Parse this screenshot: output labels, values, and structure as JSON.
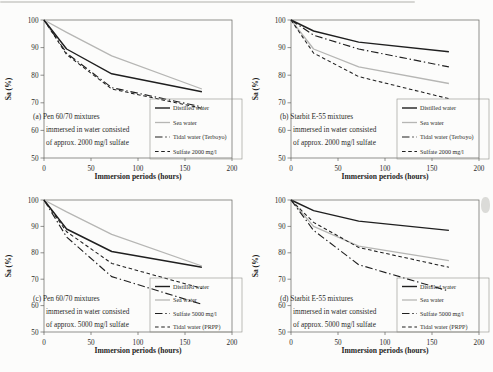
{
  "figure": {
    "colors": {
      "black_line": "#1f1f1f",
      "gray_line": "#b6b6b4",
      "frame": "#63635f",
      "legend_border": "#8f8f8b",
      "text": "#2b2b28",
      "background": "#fcfcfb"
    }
  },
  "chart_data": [
    {
      "type": "line",
      "panel": "a",
      "annotation": [
        "(a) Pen 60/70 mixtures",
        "immersed in water consisted",
        "of approx. 2000 mg/l sulfate"
      ],
      "xlabel": "Immersion periods (hours)",
      "ylabel": "Sa (%)",
      "xlim": [
        0,
        200
      ],
      "ylim": [
        50,
        100
      ],
      "xticks": [
        0,
        50,
        100,
        150,
        200
      ],
      "yticks": [
        50,
        60,
        70,
        80,
        90,
        100
      ],
      "grid": false,
      "legend_position": "bottom-right",
      "x": [
        0,
        24,
        72,
        168
      ],
      "series": [
        {
          "name": "Distilled water",
          "style": "solid-black",
          "values": [
            100,
            89.5,
            80.5,
            74
          ]
        },
        {
          "name": "Sea water",
          "style": "solid-gray",
          "values": [
            100,
            95.5,
            87,
            75
          ]
        },
        {
          "name": "Tidal water (Terboyo)",
          "style": "dashdot-black",
          "values": [
            100,
            88,
            75.5,
            68.5
          ]
        },
        {
          "name": "Sulfate 2000 mg/l",
          "style": "dash-black",
          "values": [
            100,
            87.5,
            75,
            68
          ]
        }
      ]
    },
    {
      "type": "line",
      "panel": "b",
      "annotation": [
        "(b) Starbit E-55 mixtures",
        "immersed in water consisted",
        "of approx. 2000 mg/l sulfate"
      ],
      "xlabel": "Immersion periods (hours)",
      "ylabel": "Sa (%)",
      "xlim": [
        0,
        200
      ],
      "ylim": [
        50,
        100
      ],
      "xticks": [
        0,
        50,
        100,
        150,
        200
      ],
      "yticks": [
        50,
        60,
        70,
        80,
        90,
        100
      ],
      "grid": false,
      "legend_position": "bottom-right",
      "x": [
        0,
        24,
        72,
        168
      ],
      "series": [
        {
          "name": "Distilled water",
          "style": "solid-black",
          "values": [
            100,
            96,
            92,
            88.5
          ]
        },
        {
          "name": "Sea water",
          "style": "solid-gray",
          "values": [
            100,
            89.5,
            83,
            77
          ]
        },
        {
          "name": "Tidal water (Terboyo)",
          "style": "dashdot-black",
          "values": [
            100,
            94.5,
            89.5,
            83
          ]
        },
        {
          "name": "Sulfate 2000 mg/l",
          "style": "dash-black",
          "values": [
            100,
            88,
            79.5,
            71.5
          ]
        }
      ]
    },
    {
      "type": "line",
      "panel": "c",
      "annotation": [
        "(c) Pen 60/70 mixtures",
        "immersed in water consisted",
        "of approx. 5000 mg/l sulfate"
      ],
      "xlabel": "Immersion periods (hours)",
      "ylabel": "Sa (%)",
      "xlim": [
        0,
        200
      ],
      "ylim": [
        50,
        100
      ],
      "xticks": [
        0,
        50,
        100,
        150,
        200
      ],
      "yticks": [
        50,
        60,
        70,
        80,
        90,
        100
      ],
      "grid": false,
      "legend_position": "bottom-right",
      "x": [
        0,
        24,
        72,
        168
      ],
      "series": [
        {
          "name": "Distilled water",
          "style": "solid-black",
          "values": [
            100,
            89,
            80.5,
            74.5
          ]
        },
        {
          "name": "Sea water",
          "style": "solid-gray",
          "values": [
            100,
            95.5,
            87,
            75
          ]
        },
        {
          "name": "Sulfate 5000 mg/l",
          "style": "dashdot-black",
          "values": [
            100,
            86,
            71,
            60.5
          ]
        },
        {
          "name": "Tidal water (PRPP)",
          "style": "dash-black",
          "values": [
            100,
            88,
            76,
            66.5
          ]
        }
      ]
    },
    {
      "type": "line",
      "panel": "d",
      "annotation": [
        "(d) Starbit E-55 mixtures",
        "immersed in water consisted",
        "of approx. 5000 mg/l sulfate"
      ],
      "xlabel": "Immersion periods (hours)",
      "ylabel": "Sa (%)",
      "xlim": [
        0,
        200
      ],
      "ylim": [
        50,
        100
      ],
      "xticks": [
        0,
        50,
        100,
        150,
        200
      ],
      "yticks": [
        50,
        60,
        70,
        80,
        90,
        100
      ],
      "grid": false,
      "legend_position": "bottom-right",
      "x": [
        0,
        24,
        72,
        168
      ],
      "series": [
        {
          "name": "Distilled water",
          "style": "solid-black",
          "values": [
            100,
            96,
            92,
            88.5
          ]
        },
        {
          "name": "Sea water",
          "style": "solid-gray",
          "values": [
            100,
            90,
            82.5,
            77
          ]
        },
        {
          "name": "Sulfate 5000 mg/l",
          "style": "dashdot-black",
          "values": [
            100,
            88.5,
            75.5,
            65.5
          ]
        },
        {
          "name": "Tidal water (PRPP)",
          "style": "dash-black",
          "values": [
            100,
            91.5,
            82,
            74.5
          ]
        }
      ]
    }
  ]
}
